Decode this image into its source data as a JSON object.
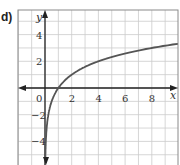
{
  "part_label": "d)",
  "chart_data": {
    "type": "line",
    "title": "",
    "xlabel": "x",
    "ylabel": "y",
    "xlim": [
      -2,
      10
    ],
    "ylim": [
      -6,
      6
    ],
    "grid": true,
    "grid_step": 1,
    "x_ticks": [
      "0",
      "2",
      "4",
      "6",
      "8"
    ],
    "y_ticks": [
      "4",
      "2",
      "-2",
      "-4"
    ],
    "series": [
      {
        "name": "y = log2(x)",
        "x": [
          0.02,
          0.05,
          0.1,
          0.25,
          0.5,
          1,
          2,
          3,
          4,
          5,
          6,
          7,
          8,
          9,
          10
        ],
        "y": [
          -5.64,
          -4.32,
          -3.32,
          -2,
          -1,
          0,
          1,
          1.58,
          2,
          2.32,
          2.58,
          2.81,
          3,
          3.17,
          3.32
        ]
      }
    ],
    "colors": {
      "curve": "#555555",
      "grid": "#cccccc",
      "axis": "#222222",
      "frame": "#888888"
    }
  }
}
